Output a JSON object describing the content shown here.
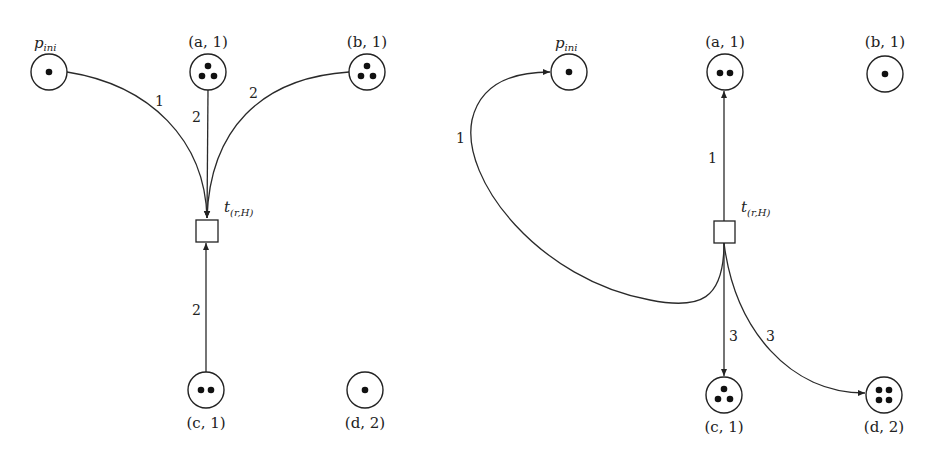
{
  "diagrams": [
    {
      "id": "before",
      "transition": {
        "name": "t",
        "subscript": "(r,H)"
      },
      "places": [
        {
          "key": "p_ini",
          "label": "p",
          "label_sub": "ini",
          "tokens": 1
        },
        {
          "key": "a1",
          "label": "(a, 1)",
          "tokens": 3
        },
        {
          "key": "b1",
          "label": "(b, 1)",
          "tokens": 3
        },
        {
          "key": "c1",
          "label": "(c, 1)",
          "tokens": 2
        },
        {
          "key": "d2",
          "label": "(d, 2)",
          "tokens": 1
        }
      ],
      "arcs": [
        {
          "from": "p_ini",
          "to": "t",
          "weight": "1"
        },
        {
          "from": "a1",
          "to": "t",
          "weight": "2"
        },
        {
          "from": "b1",
          "to": "t",
          "weight": "2"
        },
        {
          "from": "c1",
          "to": "t",
          "weight": "2"
        }
      ]
    },
    {
      "id": "after",
      "transition": {
        "name": "t",
        "subscript": "(r,H)"
      },
      "places": [
        {
          "key": "p_ini",
          "label": "p",
          "label_sub": "ini",
          "tokens": 1
        },
        {
          "key": "a1",
          "label": "(a, 1)",
          "tokens": 2
        },
        {
          "key": "b1",
          "label": "(b, 1)",
          "tokens": 1
        },
        {
          "key": "c1",
          "label": "(c, 1)",
          "tokens": 3
        },
        {
          "key": "d2",
          "label": "(d, 2)",
          "tokens": 4
        }
      ],
      "arcs": [
        {
          "from": "t",
          "to": "p_ini",
          "weight": "1"
        },
        {
          "from": "t",
          "to": "a1",
          "weight": "1"
        },
        {
          "from": "t",
          "to": "c1",
          "weight": "3"
        },
        {
          "from": "t",
          "to": "d2",
          "weight": "3"
        }
      ]
    }
  ]
}
